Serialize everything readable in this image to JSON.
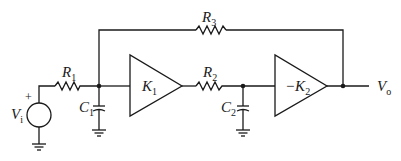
{
  "diagram": {
    "type": "circuit",
    "labels": {
      "source": {
        "main": "V",
        "sub": "i",
        "polarity": "+"
      },
      "r1": {
        "main": "R",
        "sub": "1"
      },
      "c1": {
        "main": "C",
        "sub": "1"
      },
      "k1": {
        "main": "K",
        "sub": "1"
      },
      "r2": {
        "main": "R",
        "sub": "2"
      },
      "c2": {
        "main": "C",
        "sub": "2"
      },
      "k2": {
        "main": "−K",
        "sub": "2"
      },
      "r3": {
        "main": "R",
        "sub": "3"
      },
      "output": {
        "main": "V",
        "sub": "o"
      }
    },
    "components": [
      {
        "id": "Vi",
        "kind": "voltage-source"
      },
      {
        "id": "R1",
        "kind": "resistor"
      },
      {
        "id": "C1",
        "kind": "capacitor"
      },
      {
        "id": "K1",
        "kind": "amplifier",
        "gain": "K1"
      },
      {
        "id": "R2",
        "kind": "resistor"
      },
      {
        "id": "C2",
        "kind": "capacitor"
      },
      {
        "id": "K2",
        "kind": "amplifier",
        "gain": "-K2"
      },
      {
        "id": "R3",
        "kind": "resistor",
        "role": "feedback"
      }
    ],
    "colors": {
      "ink": "#1a1a1a",
      "background": "#ffffff"
    }
  }
}
